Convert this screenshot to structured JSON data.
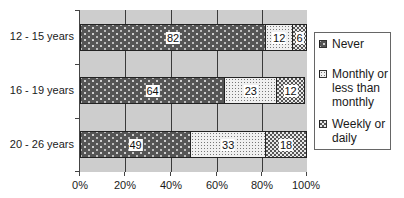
{
  "chart_data": {
    "type": "bar",
    "orientation": "horizontal",
    "stacked": true,
    "percent": true,
    "title": "",
    "xlabel": "",
    "ylabel": "",
    "categories": [
      "12 - 15 years",
      "16 - 19 years",
      "20 - 26 years"
    ],
    "series": [
      {
        "name": "Never",
        "values": [
          82,
          64,
          49
        ],
        "color": "#555555",
        "pattern": "dots-on-dark"
      },
      {
        "name": "Monthly or less than monthly",
        "values": [
          12,
          23,
          33
        ],
        "color": "#f0f0f0",
        "pattern": "fine-stipple"
      },
      {
        "name": "Weekly or daily",
        "values": [
          6,
          12,
          18
        ],
        "color": "#e8e8e8",
        "pattern": "checker"
      }
    ],
    "xlim": [
      0,
      100
    ],
    "xticks": [
      "0%",
      "20%",
      "40%",
      "60%",
      "80%",
      "100%"
    ],
    "grid": {
      "vertical": true,
      "horizontal": false
    },
    "background": "#cdcdcd",
    "legend_position": "right",
    "data_labels": true
  },
  "legend": {
    "items": [
      {
        "label": "Never"
      },
      {
        "label": "Monthly or less than monthly"
      },
      {
        "label": "Weekly or daily"
      }
    ]
  }
}
